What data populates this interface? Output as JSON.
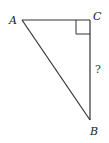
{
  "diagram": {
    "type": "right-triangle",
    "vertices": {
      "A": {
        "label": "A",
        "x": 22,
        "y": 20
      },
      "C": {
        "label": "C",
        "x": 90,
        "y": 20
      },
      "B": {
        "label": "B",
        "x": 90,
        "y": 120
      }
    },
    "right_angle_at": "C",
    "unknown_side": {
      "between": [
        "C",
        "B"
      ],
      "label": "?"
    },
    "stroke_color": "#333333"
  }
}
